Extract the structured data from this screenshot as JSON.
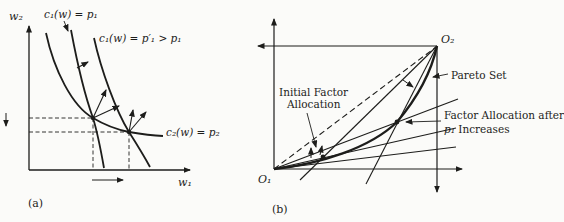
{
  "colors": {
    "ink": "#1d1d1b",
    "paper": "#fbfbf9"
  },
  "panel_a": {
    "caption": "(a)",
    "axis": {
      "y_label": "w₂",
      "x_label": "w₁"
    },
    "labels": {
      "c1_initial": "c₁(w) = p₁",
      "c1_after": "c₁(w) = p′₁ > p₁",
      "c2": "c₂(w) = p₂"
    }
  },
  "panel_b": {
    "caption": "(b)",
    "origins": {
      "o1": "O₁",
      "o2": "O₂"
    },
    "labels": {
      "pareto": "Pareto Set",
      "initial_line1": "Initial Factor",
      "initial_line2": "Allocation",
      "after_line1": "Factor Allocation after",
      "after_line2_math": "p₁",
      "after_line2_rest": " Increases"
    }
  }
}
